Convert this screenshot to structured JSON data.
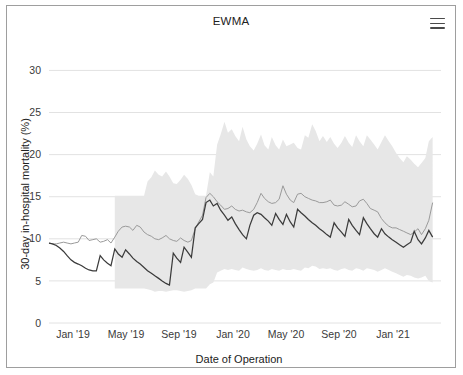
{
  "card": {
    "title": "EWMA",
    "menu_icon": "hamburger-menu-icon"
  },
  "chart_data": {
    "type": "line",
    "title": "EWMA",
    "xlabel": "Date of Operation",
    "ylabel": "30-day in-hospital mortality (%)",
    "ylim": [
      0,
      31
    ],
    "yticks": [
      0,
      5,
      10,
      15,
      20,
      25,
      30
    ],
    "ytick_labels": [
      "0",
      "5",
      "10",
      "15",
      "20",
      "25",
      "30"
    ],
    "xlim": [
      "2018-12-01",
      "2021-04-01"
    ],
    "xticks": [
      0.0667,
      0.2444,
      0.4222,
      0.6,
      0.7778,
      0.9556,
      1.1333
    ],
    "xtick_labels": [
      "Jan '19",
      "May '19",
      "Sep '19",
      "Jan '20",
      "May '20",
      "Sep '20",
      "Jan '21"
    ],
    "xtick_px": [
      72,
      125,
      178,
      232,
      285,
      338,
      392
    ],
    "grid": true,
    "grid_axis": "y",
    "legend": "none",
    "colors": {
      "observed_line": "#3b3b3b",
      "expected_line": "#9a9a9a",
      "control_band": "#e7e7e7",
      "gridline": "#e2e2e2",
      "axis_text": "#3a3a3a",
      "card_border": "#9e9e9e",
      "background": "#ffffff"
    },
    "series": [
      {
        "name": "control-limit-band",
        "type": "band",
        "note": "shaded 99% control-limit envelope, only present from ~Apr 2019 onward",
        "x": [
          0.207,
          0.218,
          0.23,
          0.241,
          0.253,
          0.264,
          0.276,
          0.287,
          0.299,
          0.31,
          0.322,
          0.333,
          0.345,
          0.356,
          0.368,
          0.379,
          0.391,
          0.402,
          0.414,
          0.425,
          0.437,
          0.448,
          0.46,
          0.471,
          0.483,
          0.494,
          0.506,
          0.517,
          0.529,
          0.54,
          0.552,
          0.563,
          0.575,
          0.586,
          0.598,
          0.609,
          0.621,
          0.632,
          0.644,
          0.655,
          0.667,
          0.678,
          0.69,
          0.701,
          0.713,
          0.724,
          0.736,
          0.747,
          0.759,
          0.77,
          0.782,
          0.793,
          0.805,
          0.816,
          0.828,
          0.839,
          0.851,
          0.862,
          0.874,
          0.885,
          0.897,
          0.908,
          0.92,
          0.931,
          0.943,
          0.954,
          0.966,
          0.977,
          0.989,
          1.0,
          1.011,
          1.023,
          1.034,
          1.046,
          1.057,
          1.069,
          1.08,
          1.092,
          1.103,
          1.115,
          1.126,
          1.138,
          1.149,
          1.161,
          1.172,
          1.184,
          1.195,
          1.207
        ],
        "upper": [
          15.1,
          15.1,
          15.1,
          15.1,
          15.1,
          15.1,
          15.1,
          15.1,
          15.1,
          16.8,
          17.3,
          18.1,
          17.6,
          17.4,
          18.0,
          17.4,
          16.6,
          16.5,
          17.0,
          17.6,
          17.1,
          16.4,
          15.3,
          15.1,
          15.1,
          15.1,
          17.9,
          17.4,
          21.2,
          22.4,
          23.9,
          22.6,
          23.0,
          22.2,
          21.6,
          23.3,
          21.8,
          21.0,
          20.5,
          21.3,
          22.4,
          21.1,
          20.6,
          22.1,
          21.1,
          20.6,
          21.8,
          21.0,
          21.2,
          21.4,
          20.8,
          20.6,
          22.3,
          22.0,
          23.6,
          22.8,
          21.6,
          22.2,
          21.5,
          22.1,
          21.3,
          20.8,
          21.4,
          22.2,
          21.4,
          20.9,
          22.3,
          21.6,
          21.0,
          22.3,
          21.8,
          21.2,
          20.6,
          21.5,
          22.3,
          21.6,
          21.0,
          20.2,
          19.6,
          19.1,
          19.8,
          19.4,
          18.9,
          18.5,
          19.0,
          19.6,
          21.6,
          22.1
        ],
        "lower": [
          4.1,
          4.1,
          4.1,
          4.1,
          4.1,
          4.1,
          4.1,
          4.1,
          4.1,
          4.0,
          3.9,
          3.7,
          3.8,
          3.8,
          3.7,
          3.8,
          3.9,
          3.9,
          3.8,
          3.7,
          3.8,
          3.9,
          4.1,
          4.1,
          4.1,
          4.1,
          4.6,
          4.8,
          6.0,
          6.2,
          6.4,
          6.3,
          6.4,
          6.3,
          6.2,
          6.6,
          6.4,
          6.3,
          6.2,
          6.3,
          6.5,
          6.3,
          6.2,
          6.4,
          6.3,
          6.2,
          6.4,
          6.3,
          6.3,
          6.4,
          6.3,
          6.2,
          6.6,
          6.5,
          6.8,
          6.7,
          6.4,
          6.5,
          6.4,
          6.5,
          6.3,
          6.2,
          6.4,
          6.5,
          6.3,
          6.2,
          6.5,
          6.4,
          6.2,
          6.5,
          6.4,
          6.3,
          6.1,
          6.3,
          6.5,
          6.3,
          6.1,
          5.9,
          5.7,
          5.5,
          5.7,
          5.6,
          5.4,
          5.3,
          5.4,
          5.6,
          5.0,
          4.8
        ]
      },
      {
        "name": "expected-mortality",
        "type": "line",
        "color": "#9a9a9a",
        "x": [
          0.0,
          0.011,
          0.023,
          0.034,
          0.046,
          0.057,
          0.069,
          0.08,
          0.092,
          0.103,
          0.115,
          0.126,
          0.138,
          0.149,
          0.161,
          0.172,
          0.184,
          0.195,
          0.207,
          0.218,
          0.23,
          0.241,
          0.253,
          0.264,
          0.276,
          0.287,
          0.299,
          0.31,
          0.322,
          0.333,
          0.345,
          0.356,
          0.368,
          0.379,
          0.391,
          0.402,
          0.414,
          0.425,
          0.437,
          0.448,
          0.46,
          0.471,
          0.483,
          0.494,
          0.506,
          0.517,
          0.529,
          0.54,
          0.552,
          0.563,
          0.575,
          0.586,
          0.598,
          0.609,
          0.621,
          0.632,
          0.644,
          0.655,
          0.667,
          0.678,
          0.69,
          0.701,
          0.713,
          0.724,
          0.736,
          0.747,
          0.759,
          0.77,
          0.782,
          0.793,
          0.805,
          0.816,
          0.828,
          0.839,
          0.851,
          0.862,
          0.874,
          0.885,
          0.897,
          0.908,
          0.92,
          0.931,
          0.943,
          0.954,
          0.966,
          0.977,
          0.989,
          1.0,
          1.011,
          1.023,
          1.034,
          1.046,
          1.057,
          1.069,
          1.08,
          1.092,
          1.103,
          1.115,
          1.126,
          1.138,
          1.149,
          1.161,
          1.172,
          1.184,
          1.195,
          1.207
        ],
        "y": [
          9.5,
          9.4,
          9.4,
          9.5,
          9.6,
          9.5,
          9.4,
          9.5,
          9.6,
          10.4,
          10.3,
          9.8,
          9.9,
          10.0,
          9.6,
          9.7,
          9.9,
          9.5,
          10.2,
          10.9,
          11.4,
          11.5,
          11.4,
          11.0,
          11.6,
          11.4,
          10.8,
          10.5,
          10.3,
          10.0,
          9.9,
          10.1,
          10.4,
          10.0,
          9.8,
          9.7,
          10.1,
          9.8,
          9.6,
          9.8,
          11.2,
          12.0,
          12.8,
          14.9,
          15.4,
          15.0,
          14.4,
          14.0,
          13.5,
          13.6,
          13.9,
          13.5,
          13.3,
          13.4,
          13.2,
          13.1,
          13.5,
          14.3,
          15.4,
          14.8,
          14.4,
          14.2,
          14.3,
          14.7,
          16.3,
          15.3,
          14.6,
          14.3,
          15.3,
          15.4,
          15.0,
          14.8,
          14.6,
          14.5,
          14.3,
          14.3,
          14.4,
          14.6,
          14.0,
          13.9,
          14.0,
          14.4,
          14.1,
          13.8,
          13.9,
          14.5,
          14.7,
          14.2,
          13.6,
          13.4,
          13.2,
          12.4,
          11.9,
          11.5,
          11.3,
          11.3,
          11.1,
          10.9,
          10.7,
          10.5,
          10.8,
          11.2,
          10.5,
          11.2,
          12.2,
          14.3
        ]
      },
      {
        "name": "observed-ewma-mortality",
        "type": "line",
        "color": "#3b3b3b",
        "x": [
          0.0,
          0.011,
          0.023,
          0.034,
          0.046,
          0.057,
          0.069,
          0.08,
          0.092,
          0.103,
          0.115,
          0.126,
          0.138,
          0.149,
          0.161,
          0.172,
          0.184,
          0.195,
          0.207,
          0.218,
          0.23,
          0.241,
          0.253,
          0.264,
          0.276,
          0.287,
          0.299,
          0.31,
          0.322,
          0.333,
          0.345,
          0.356,
          0.368,
          0.379,
          0.391,
          0.402,
          0.414,
          0.425,
          0.437,
          0.448,
          0.46,
          0.471,
          0.483,
          0.494,
          0.506,
          0.517,
          0.529,
          0.54,
          0.552,
          0.563,
          0.575,
          0.586,
          0.598,
          0.609,
          0.621,
          0.632,
          0.644,
          0.655,
          0.667,
          0.678,
          0.69,
          0.701,
          0.713,
          0.724,
          0.736,
          0.747,
          0.759,
          0.77,
          0.782,
          0.793,
          0.805,
          0.816,
          0.828,
          0.839,
          0.851,
          0.862,
          0.874,
          0.885,
          0.897,
          0.908,
          0.92,
          0.931,
          0.943,
          0.954,
          0.966,
          0.977,
          0.989,
          1.0,
          1.011,
          1.023,
          1.034,
          1.046,
          1.057,
          1.069,
          1.08,
          1.092,
          1.103,
          1.115,
          1.126,
          1.138,
          1.149,
          1.161,
          1.172,
          1.184,
          1.195,
          1.207
        ],
        "y": [
          9.5,
          9.4,
          9.2,
          8.9,
          8.5,
          8.0,
          7.5,
          7.2,
          7.0,
          6.8,
          6.5,
          6.3,
          6.2,
          6.2,
          8.0,
          7.5,
          7.1,
          6.8,
          8.8,
          8.2,
          7.8,
          8.7,
          8.2,
          7.7,
          7.3,
          7.0,
          6.6,
          6.2,
          5.9,
          5.6,
          5.3,
          5.0,
          4.7,
          4.5,
          8.3,
          7.7,
          7.2,
          9.0,
          8.4,
          7.8,
          11.3,
          11.8,
          12.3,
          14.3,
          14.6,
          13.9,
          14.2,
          13.4,
          12.8,
          12.2,
          12.6,
          11.8,
          11.1,
          10.5,
          10.0,
          11.6,
          12.8,
          13.1,
          12.9,
          12.5,
          12.1,
          11.6,
          13.0,
          12.3,
          11.7,
          12.9,
          12.0,
          11.4,
          13.5,
          13.1,
          12.7,
          12.3,
          11.9,
          11.6,
          11.2,
          10.9,
          10.5,
          10.2,
          11.9,
          11.3,
          10.8,
          10.3,
          12.3,
          11.6,
          11.0,
          10.5,
          12.5,
          11.8,
          11.2,
          10.6,
          10.2,
          11.2,
          10.6,
          10.2,
          9.9,
          9.6,
          9.3,
          9.0,
          9.3,
          9.6,
          10.9,
          9.9,
          9.4,
          10.1,
          11.0,
          10.2
        ]
      }
    ]
  }
}
